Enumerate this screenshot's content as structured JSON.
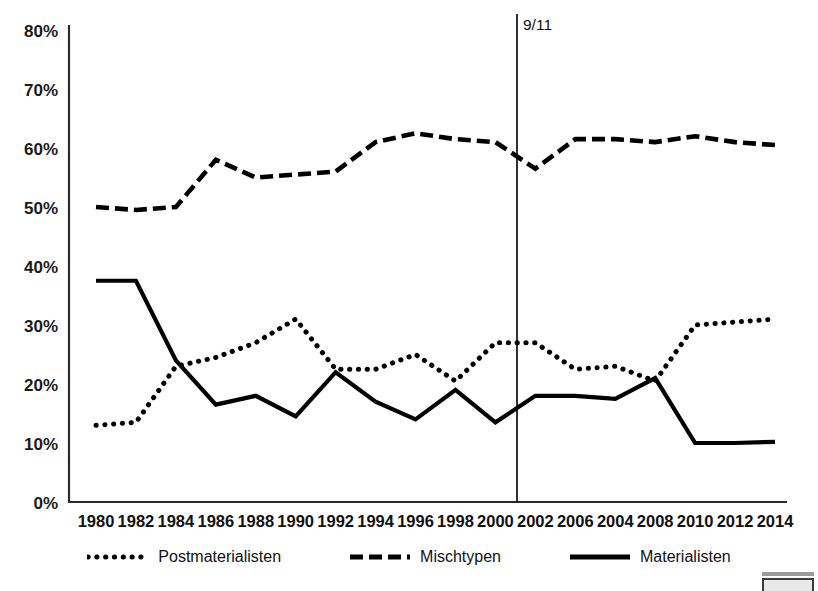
{
  "chart": {
    "title": "",
    "event_marker": {
      "label": "9/11",
      "between": "2000-2002"
    },
    "yaxis": {
      "ticks": [
        "0%",
        "10%",
        "20%",
        "30%",
        "40%",
        "50%",
        "60%",
        "70%",
        "80%"
      ]
    },
    "legend": {
      "items": [
        {
          "label": "Postmaterialisten",
          "style": "dotted"
        },
        {
          "label": "Mischtypen",
          "style": "dashed"
        },
        {
          "label": "Materialisten",
          "style": "solid"
        }
      ]
    }
  },
  "chart_data": {
    "type": "line",
    "title": "",
    "xlabel": "",
    "ylabel": "",
    "ylim": [
      0,
      80
    ],
    "ytick_values": [
      0,
      10,
      20,
      30,
      40,
      50,
      60,
      70,
      80
    ],
    "ytick_labels": [
      "0%",
      "10%",
      "20%",
      "30%",
      "40%",
      "50%",
      "60%",
      "70%",
      "80%"
    ],
    "grid": false,
    "legend_position": "bottom",
    "categories": [
      "1980",
      "1982",
      "1984",
      "1986",
      "1988",
      "1990",
      "1992",
      "1994",
      "1996",
      "1998",
      "2000",
      "2002",
      "2006",
      "2004",
      "2008",
      "2010",
      "2012",
      "2014"
    ],
    "annotations": [
      {
        "text": "9/11",
        "x": "between 2000 and 2002",
        "type": "vertical-line"
      }
    ],
    "series": [
      {
        "name": "Postmaterialisten",
        "style": "dotted",
        "color": "#000000",
        "values": [
          13,
          13.5,
          23,
          24.5,
          27,
          31,
          22.5,
          22.5,
          25,
          20.5,
          27,
          27,
          22.5,
          23,
          20.5,
          30,
          30.5,
          31
        ]
      },
      {
        "name": "Mischtypen",
        "style": "dashed",
        "color": "#000000",
        "values": [
          50,
          49.5,
          50,
          58,
          55,
          55.5,
          56,
          61,
          62.5,
          61.5,
          61,
          56.5,
          61.5,
          61.5,
          61,
          62,
          61,
          60.5
        ]
      },
      {
        "name": "Materialisten",
        "style": "solid",
        "color": "#000000",
        "values": [
          37.5,
          37.5,
          24,
          16.5,
          18,
          14.5,
          22,
          17,
          14,
          19,
          13.5,
          18,
          18,
          17.5,
          21,
          10,
          10,
          10.2
        ]
      }
    ]
  }
}
